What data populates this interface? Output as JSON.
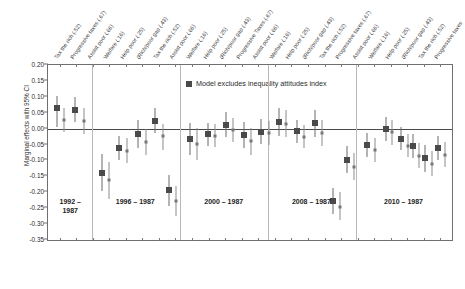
{
  "chart_data": {
    "type": "scatter",
    "title": "",
    "xlabel": "",
    "ylabel": "Marginal effects with 95% CI",
    "ylim": [
      -0.35,
      0.2
    ],
    "ytick_labels": [
      "0.20",
      "0.15",
      "0.10",
      "0.05",
      "0.00",
      "-0.05",
      "-0.10",
      "-0.15",
      "-0.20",
      "-0.25",
      "-0.30",
      "-0.35"
    ],
    "ytick_values": [
      0.2,
      0.15,
      0.1,
      0.05,
      0.0,
      -0.05,
      -0.1,
      -0.15,
      -0.2,
      -0.25,
      -0.3,
      -0.35
    ],
    "grid": false,
    "zero_reference_line": true,
    "legend": {
      "position": "inside-top-center",
      "entries": [
        {
          "label": "Model excludes inequality attitudes index",
          "marker": "filled-square",
          "color": "#4a4a4a"
        }
      ]
    },
    "panels": [
      {
        "caption": "1992 –\n1987",
        "variables": [
          "Tax the rich (.52)",
          "Progressive taxes (.67)",
          "Assist poor (.66)"
        ]
      },
      {
        "caption": "1996 – 1987",
        "variables": [
          "Welfare (.16)",
          "Help poor (.25)",
          "(Rich/poor gap (.43)",
          "Tax the rich (.52)",
          "Progressive taxes (.67)",
          "Assist poor (.66)"
        ]
      },
      {
        "caption": "2000 – 1987",
        "variables": [
          "Welfare (.16)",
          "Help poor (.25)",
          "(Rich/poor gap (.43)",
          "Tax the rich (.52)",
          "Progressive taxes (.67)",
          "Assist poor (.66)"
        ]
      },
      {
        "caption": "2008 – 1987",
        "variables": [
          "Welfare (.16)",
          "Help poor (.25)",
          "(Rich/poor gap (.43)",
          "Progressive Taxes (.67)",
          "Assist poor (.66)",
          "Welfare (.16)"
        ]
      },
      {
        "caption": "2010 – 1987",
        "variables": [
          "Help poor (.25)",
          "(Rich/poor gap (.43)",
          "Tax the rich (.52)",
          "Progressive taxes (.67)",
          "Assist poor (.66)",
          "Welfare (.16)"
        ]
      }
    ],
    "x_tick_labels": [
      "Tax the rich (.52)",
      "Progressive taxes (.67)",
      "Assist poor (.66)",
      "Welfare (.16)",
      "Help poor (.25)",
      "(Rich/poor gap (.43)",
      "Tax the rich (.52)",
      "Assist poor (.66)",
      "Welfare (.16)",
      "Help poor (.25)",
      "(Rich/poor gap (.43)",
      "Progressive Taxes (.67)",
      "Assist poor (.66)",
      "Welfare (.16)",
      "Help poor (.25)",
      "(Rich/poor gap (.43)",
      "Tax the rich (.52)",
      "Progressive taxes (.67)",
      "Assist poor (.66)",
      "Welfare (.16)",
      "Help poor (.25)",
      "(Rich/poor gap (.43)",
      "Tax the rich (.52)",
      "Progressive taxes"
    ],
    "panel_boundaries_x": [
      0.108,
      0.326,
      0.545,
      0.762
    ],
    "series": [
      {
        "name": "Model excludes inequality attitudes index",
        "marker": "large-square",
        "color": "#4a4a4a",
        "points": [
          {
            "x": 0.022,
            "y": 0.064,
            "lo": 0.005,
            "hi": 0.103
          },
          {
            "x": 0.068,
            "y": 0.059,
            "lo": 0.021,
            "hi": 0.098
          },
          {
            "x": 0.133,
            "y": -0.138,
            "lo": -0.196,
            "hi": -0.08
          },
          {
            "x": 0.176,
            "y": -0.06,
            "lo": -0.098,
            "hi": -0.022
          },
          {
            "x": 0.222,
            "y": -0.016,
            "lo": -0.06,
            "hi": 0.028
          },
          {
            "x": 0.266,
            "y": 0.025,
            "lo": -0.015,
            "hi": 0.066
          },
          {
            "x": 0.3,
            "y": -0.194,
            "lo": -0.243,
            "hi": -0.146
          },
          {
            "x": 0.352,
            "y": -0.032,
            "lo": -0.084,
            "hi": 0.018
          },
          {
            "x": 0.396,
            "y": -0.018,
            "lo": -0.054,
            "hi": 0.018
          },
          {
            "x": 0.44,
            "y": 0.013,
            "lo": -0.026,
            "hi": 0.053
          },
          {
            "x": 0.485,
            "y": -0.02,
            "lo": -0.062,
            "hi": 0.02
          },
          {
            "x": 0.528,
            "y": -0.009,
            "lo": -0.048,
            "hi": 0.03
          },
          {
            "x": 0.572,
            "y": 0.021,
            "lo": -0.022,
            "hi": 0.064
          },
          {
            "x": 0.616,
            "y": -0.008,
            "lo": -0.044,
            "hi": 0.028
          },
          {
            "x": 0.66,
            "y": 0.017,
            "lo": -0.026,
            "hi": 0.058
          },
          {
            "x": 0.706,
            "y": -0.227,
            "lo": -0.268,
            "hi": -0.186
          },
          {
            "x": 0.74,
            "y": -0.097,
            "lo": -0.14,
            "hi": -0.056
          },
          {
            "x": 0.79,
            "y": -0.052,
            "lo": -0.09,
            "hi": -0.013
          },
          {
            "x": 0.836,
            "y": -0.002,
            "lo": -0.04,
            "hi": 0.036
          },
          {
            "x": 0.874,
            "y": -0.031,
            "lo": -0.066,
            "hi": 0.004
          },
          {
            "x": 0.904,
            "y": -0.054,
            "lo": -0.093,
            "hi": -0.016
          },
          {
            "x": 0.934,
            "y": -0.092,
            "lo": -0.135,
            "hi": -0.05
          },
          {
            "x": 0.966,
            "y": -0.062,
            "lo": -0.1,
            "hi": -0.024
          }
        ]
      },
      {
        "name": "Full model",
        "marker": "small-square",
        "color": "#777777",
        "points": [
          {
            "x": 0.04,
            "y": 0.027,
            "lo": -0.01,
            "hi": 0.066
          },
          {
            "x": 0.09,
            "y": 0.024,
            "lo": -0.016,
            "hi": 0.064
          },
          {
            "x": 0.152,
            "y": -0.162,
            "lo": -0.22,
            "hi": -0.106
          },
          {
            "x": 0.196,
            "y": -0.069,
            "lo": -0.108,
            "hi": -0.03
          },
          {
            "x": 0.242,
            "y": -0.042,
            "lo": -0.084,
            "hi": 0.0
          },
          {
            "x": 0.284,
            "y": -0.024,
            "lo": -0.066,
            "hi": 0.016
          },
          {
            "x": 0.316,
            "y": -0.227,
            "lo": -0.274,
            "hi": -0.18
          },
          {
            "x": 0.37,
            "y": -0.048,
            "lo": -0.1,
            "hi": 0.003
          },
          {
            "x": 0.414,
            "y": -0.022,
            "lo": -0.058,
            "hi": 0.014
          },
          {
            "x": 0.458,
            "y": -0.004,
            "lo": -0.042,
            "hi": 0.035
          },
          {
            "x": 0.502,
            "y": -0.039,
            "lo": -0.082,
            "hi": 0.003
          },
          {
            "x": 0.546,
            "y": -0.014,
            "lo": -0.052,
            "hi": 0.024
          },
          {
            "x": 0.59,
            "y": 0.016,
            "lo": -0.026,
            "hi": 0.06
          },
          {
            "x": 0.634,
            "y": -0.026,
            "lo": -0.062,
            "hi": 0.01
          },
          {
            "x": 0.678,
            "y": -0.013,
            "lo": -0.054,
            "hi": 0.028
          },
          {
            "x": 0.722,
            "y": -0.245,
            "lo": -0.288,
            "hi": -0.2
          },
          {
            "x": 0.758,
            "y": -0.12,
            "lo": -0.16,
            "hi": -0.078
          },
          {
            "x": 0.81,
            "y": -0.066,
            "lo": -0.104,
            "hi": -0.028
          },
          {
            "x": 0.852,
            "y": -0.01,
            "lo": -0.05,
            "hi": 0.028
          },
          {
            "x": 0.89,
            "y": -0.053,
            "lo": -0.09,
            "hi": -0.016
          },
          {
            "x": 0.918,
            "y": -0.085,
            "lo": -0.124,
            "hi": -0.046
          },
          {
            "x": 0.95,
            "y": -0.11,
            "lo": -0.15,
            "hi": -0.07
          },
          {
            "x": 0.982,
            "y": -0.082,
            "lo": -0.122,
            "hi": -0.042
          }
        ]
      }
    ],
    "panel_captions": [
      {
        "text": "1992 –\n1987",
        "cx": 0.055
      },
      {
        "text": "1996 – 1987",
        "cx": 0.216
      },
      {
        "text": "2000 – 1987",
        "cx": 0.435
      },
      {
        "text": "2008 – 1987",
        "cx": 0.652
      },
      {
        "text": "2010 – 1987",
        "cx": 0.88
      }
    ]
  }
}
